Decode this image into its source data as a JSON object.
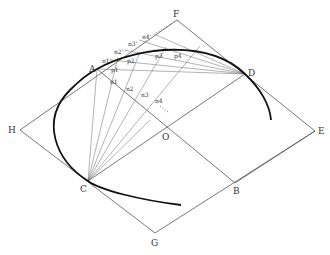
{
  "diagram": {
    "type": "geometric construction",
    "points": {
      "A": {
        "label": "A",
        "x": 97,
        "y": 69
      },
      "B": {
        "label": "B",
        "x": 235,
        "y": 183
      },
      "C": {
        "label": "C",
        "x": 88,
        "y": 181
      },
      "D": {
        "label": "D",
        "x": 245,
        "y": 74
      },
      "E": {
        "label": "E",
        "x": 315,
        "y": 131
      },
      "F": {
        "label": "F",
        "x": 177,
        "y": 20
      },
      "G": {
        "label": "G",
        "x": 155,
        "y": 233
      },
      "H": {
        "label": "H",
        "x": 20,
        "y": 130
      },
      "O": {
        "label": "O",
        "x": 166,
        "y": 128
      }
    },
    "labels": {
      "A": "A",
      "B": "B",
      "C": "C",
      "D": "D",
      "E": "E",
      "F": "F",
      "G": "G",
      "H": "H",
      "O": "O"
    },
    "upper_division_labels": [
      "n1'",
      "n2'",
      "n3'",
      "n4'"
    ],
    "lower_division_labels": [
      "n1",
      "n2",
      "n3",
      "n4"
    ],
    "curve_point_labels": [
      "p1",
      "p2",
      "p3",
      "p4"
    ],
    "n_label": "n",
    "p_label": "p",
    "subs": [
      "1",
      "2",
      "3",
      "4"
    ],
    "prime": "'"
  }
}
